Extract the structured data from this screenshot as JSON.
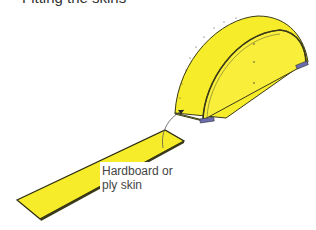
{
  "title": "Fitting the skins",
  "diagram": {
    "parts": [
      {
        "name": "half-round former",
        "fill": "#f7ec2a"
      },
      {
        "name": "flat skin strip",
        "fill": "#f7ec2a"
      }
    ],
    "label": {
      "line1": "Hardboard or",
      "line2": "ply skin"
    },
    "colors": {
      "fill": "#f7ec2a",
      "outline": "#3a3a1a",
      "block": "#6b6bb0"
    }
  }
}
